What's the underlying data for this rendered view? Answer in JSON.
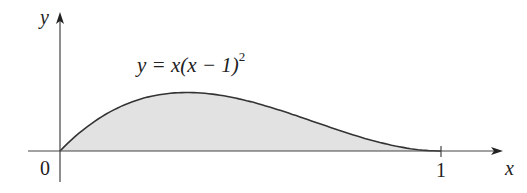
{
  "figure": {
    "equation_label": "y = x(x − 1)²",
    "equation_parts": {
      "lhs": "y = x(x − 1)",
      "exp": "2"
    },
    "axis_x_label": "x",
    "axis_y_label": "y",
    "origin_label": "0",
    "tick_label_1": "1",
    "fill_color": "#e2e2e2",
    "curve_color": "#333333",
    "axis_color": "#444444"
  },
  "chart_data": {
    "type": "area",
    "function": "y = x(x-1)^2",
    "x_range": [
      0,
      1
    ],
    "x_ticks": [
      "0",
      "1"
    ],
    "xlabel": "x",
    "ylabel": "y",
    "shaded_region": "area under curve from x=0 to x=1",
    "samples": [
      [
        0,
        0
      ],
      [
        0.1,
        0.081
      ],
      [
        0.2,
        0.128
      ],
      [
        0.333,
        0.148
      ],
      [
        0.5,
        0.125
      ],
      [
        0.7,
        0.063
      ],
      [
        0.9,
        0.009
      ],
      [
        1,
        0
      ]
    ]
  }
}
